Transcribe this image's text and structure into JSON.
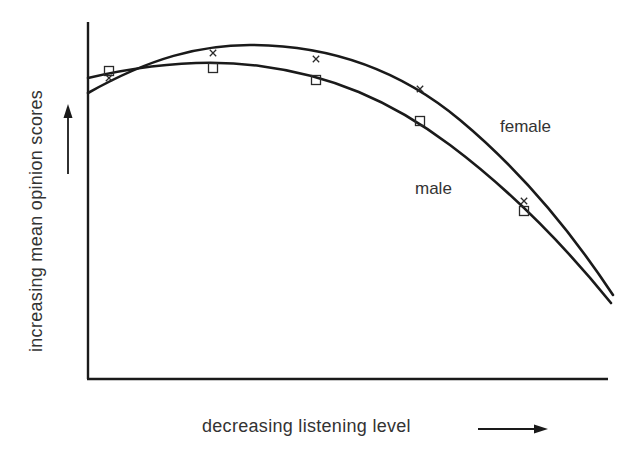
{
  "chart_data": {
    "type": "line",
    "title": "",
    "xlabel": "decreasing listening level",
    "ylabel": "increasing mean opinion scores",
    "x_axis_arrow": "right",
    "y_axis_arrow": "up",
    "grid": false,
    "legend": "inline labels",
    "x_ticks": [],
    "y_ticks": [],
    "x_points": [
      1,
      2,
      3,
      4,
      5
    ],
    "series": [
      {
        "name": "female",
        "marker": "x",
        "points_px": [
          [
            109,
            78
          ],
          [
            213,
            53
          ],
          [
            316,
            59
          ],
          [
            420,
            89
          ],
          [
            524,
            201
          ]
        ],
        "curve_path": "M88,93 C150,58 200,45 250,45 C330,45 400,70 460,120 C520,170 570,230 613,295",
        "label_pos": [
          500,
          132
        ]
      },
      {
        "name": "male",
        "marker": "square",
        "points_px": [
          [
            109,
            71
          ],
          [
            213,
            68
          ],
          [
            316,
            80
          ],
          [
            420,
            121
          ],
          [
            524,
            211
          ]
        ],
        "curve_path": "M88,78 C140,66 200,58 260,66 C330,75 390,100 450,145 C510,190 560,240 611,303",
        "label_pos": [
          415,
          194
        ]
      }
    ]
  },
  "labels": {
    "female": "female",
    "male": "male",
    "xlabel": "decreasing listening level",
    "ylabel": "increasing mean opinion scores"
  }
}
